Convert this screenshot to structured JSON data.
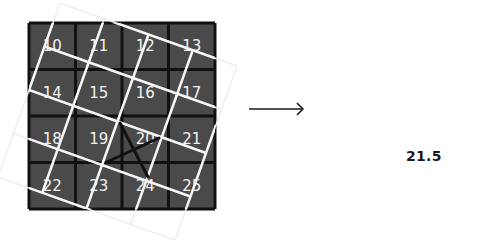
{
  "figure": {
    "source_grid": {
      "rows": 4,
      "cols": 4,
      "origin": [
        29,
        23
      ],
      "cell_size": 46.5,
      "fill_color": "#4a4a4a",
      "line_color": "#111111",
      "labels": [
        [
          "10",
          "11",
          "12",
          "13"
        ],
        [
          "14",
          "15",
          "16",
          "17"
        ],
        [
          "18",
          "19",
          "20",
          "21"
        ],
        [
          "22",
          "23",
          "24",
          "25"
        ]
      ]
    },
    "rotated_grid": {
      "corners": {
        "top_left": [
          60,
          3
        ],
        "top_right": [
          237,
          66
        ],
        "bottom_right": [
          175,
          240
        ],
        "bottom_left": [
          -2,
          177
        ]
      },
      "divisions": 4,
      "line_color_inside": "#f5f5f5",
      "line_color_outside": "#eeeeee"
    },
    "sample_marker": {
      "line_color": "#111111",
      "lines": [
        [
          [
            120,
            123
          ],
          [
            148,
            177
          ]
        ],
        [
          [
            107,
            162
          ],
          [
            159,
            138
          ]
        ]
      ]
    },
    "arrow": {
      "icon": "right-arrow-icon",
      "from": [
        249,
        109
      ],
      "to": [
        303,
        109
      ],
      "color": "#1a1a1a"
    },
    "result": {
      "value": "21.5"
    }
  }
}
